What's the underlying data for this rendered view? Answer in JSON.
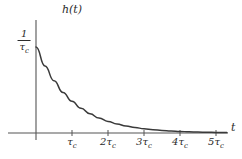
{
  "figure": {
    "background_color": "#ffffff",
    "stroke_color": "#3a3a3a",
    "axis_color": "#555555",
    "y_axis_label": "h(t)",
    "x_axis_label": "t",
    "peak_label": {
      "numerator": "1",
      "denominator_symbol": "τ",
      "denominator_subscript": "c"
    }
  },
  "ticks": [
    {
      "label_main": "τ",
      "label_sub": "c",
      "coefficient": ""
    },
    {
      "label_main": "τ",
      "label_sub": "c",
      "coefficient": "2"
    },
    {
      "label_main": "τ",
      "label_sub": "c",
      "coefficient": "3"
    },
    {
      "label_main": "τ",
      "label_sub": "c",
      "coefficient": "4"
    },
    {
      "label_main": "τ",
      "label_sub": "c",
      "coefficient": "5"
    }
  ],
  "chart_data": {
    "type": "line",
    "title": "",
    "subtitle": "",
    "xlabel": "t",
    "ylabel": "h(t)",
    "function": "h(t) = (1/τc) · exp(-t/τc)",
    "xlim": [
      0,
      5.3
    ],
    "ylim": [
      0,
      1.0
    ],
    "grid": false,
    "legend": null,
    "xticks": [
      1,
      2,
      3,
      4,
      5
    ],
    "xticklabels": [
      "τc",
      "2τc",
      "3τc",
      "4τc",
      "5τc"
    ],
    "yticks": [
      1.0
    ],
    "yticklabels": [
      "1/τc"
    ],
    "x": [
      0,
      0.25,
      0.5,
      0.75,
      1.0,
      1.25,
      1.5,
      1.75,
      2.0,
      2.25,
      2.5,
      2.75,
      3.0,
      3.25,
      3.5,
      3.75,
      4.0,
      4.25,
      4.5,
      4.75,
      5.0,
      5.3
    ],
    "values": [
      1.0,
      0.779,
      0.607,
      0.472,
      0.368,
      0.287,
      0.223,
      0.174,
      0.135,
      0.105,
      0.082,
      0.064,
      0.05,
      0.039,
      0.03,
      0.024,
      0.018,
      0.014,
      0.011,
      0.009,
      0.007,
      0.005
    ],
    "annotations": []
  }
}
